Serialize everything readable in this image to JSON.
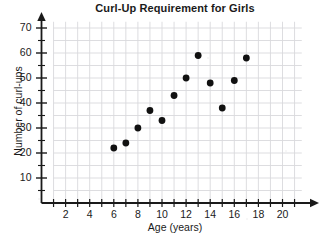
{
  "chart_data": {
    "type": "scatter",
    "title": "Curl-Up Requirement for Girls",
    "xlabel": "Age (years)",
    "ylabel": "Number of curl-ups",
    "xlim": [
      0,
      20.8
    ],
    "ylim": [
      0,
      72
    ],
    "grid": true,
    "legend": "none",
    "x_major_step": 2,
    "x_minor_step": 1,
    "y_major_step": 10,
    "y_minor_step": 5,
    "x_tick_labels": [
      "2",
      "4",
      "6",
      "8",
      "10",
      "12",
      "14",
      "16",
      "18",
      "20"
    ],
    "x_tick_values": [
      2,
      4,
      6,
      8,
      10,
      12,
      14,
      16,
      18,
      20
    ],
    "y_tick_labels": [
      "10",
      "20",
      "30",
      "40",
      "50",
      "60",
      "70"
    ],
    "y_tick_values": [
      10,
      20,
      30,
      40,
      50,
      60,
      70
    ],
    "points": [
      {
        "x": 6,
        "y": 22
      },
      {
        "x": 7,
        "y": 24
      },
      {
        "x": 8,
        "y": 30
      },
      {
        "x": 9,
        "y": 37
      },
      {
        "x": 10,
        "y": 33
      },
      {
        "x": 11,
        "y": 43
      },
      {
        "x": 12,
        "y": 50
      },
      {
        "x": 13,
        "y": 59
      },
      {
        "x": 14,
        "y": 48
      },
      {
        "x": 15,
        "y": 38
      },
      {
        "x": 16,
        "y": 49
      },
      {
        "x": 17,
        "y": 58
      }
    ],
    "marker_color": "#111111",
    "grid_color": "#d9d9dd",
    "axis_color": "#1a1a1a"
  }
}
